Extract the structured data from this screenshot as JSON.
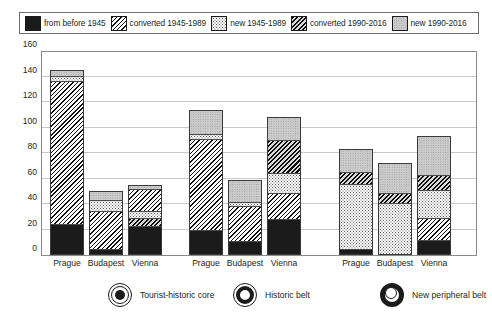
{
  "series_legend": [
    {
      "label": "from before 1945",
      "pattern": "solid-black",
      "fill_class": "f-black"
    },
    {
      "label": "converted 1945-1989",
      "pattern": "diagonal-hatch",
      "fill_class": "f-hatch"
    },
    {
      "label": "new 1945-1989",
      "pattern": "fine-dots",
      "fill_class": "f-dots"
    },
    {
      "label": "converted 1990-2016",
      "pattern": "dense-hatch",
      "fill_class": "f-hatch2"
    },
    {
      "label": "new 1990-2016",
      "pattern": "light-gray",
      "fill_class": "f-lgray"
    }
  ],
  "zone_legend": [
    {
      "label": "Tourist-historic core",
      "icon": "target-filled-circle-icon",
      "icon_class": "ic-core"
    },
    {
      "label": "Historic belt",
      "icon": "thick-ring-circle-icon",
      "icon_class": "ic-belt"
    },
    {
      "label": "New peripheral belt",
      "icon": "thick-outer-ring-circle-icon",
      "icon_class": "ic-periph"
    }
  ],
  "chart_data": {
    "type": "bar",
    "subtype": "stacked-grouped",
    "title": "",
    "xlabel": "",
    "ylabel": "",
    "ylim": [
      0,
      160
    ],
    "yticks": [
      0,
      20,
      40,
      60,
      80,
      100,
      120,
      140,
      160
    ],
    "grid": true,
    "legend_position": "top",
    "categories": [
      "Prague",
      "Budapest",
      "Vienna"
    ],
    "groups": [
      "Tourist-historic core",
      "Historic belt",
      "New peripheral belt"
    ],
    "series": [
      {
        "name": "from before 1945",
        "values": [
          [
            23,
            3,
            22
          ],
          [
            18,
            10,
            27
          ],
          [
            3,
            0,
            10
          ]
        ]
      },
      {
        "name": "converted 1945-1989",
        "values": [
          [
            113,
            31,
            18
          ],
          [
            73,
            28,
            21
          ],
          [
            0,
            0,
            18
          ]
        ]
      },
      {
        "name": "new 1945-1989",
        "values": [
          [
            4,
            9,
            6
          ],
          [
            4,
            3,
            16
          ],
          [
            52,
            40,
            22
          ]
        ]
      },
      {
        "name": "converted 1990-2016",
        "values": [
          [
            0,
            0,
            6
          ],
          [
            0,
            0,
            26
          ],
          [
            10,
            8,
            12
          ]
        ]
      },
      {
        "name": "new 1990-2016",
        "values": [
          [
            5,
            7,
            3
          ],
          [
            19,
            18,
            18
          ],
          [
            18,
            24,
            31
          ]
        ]
      }
    ],
    "totals": [
      [
        145,
        50,
        55
      ],
      [
        114,
        59,
        108
      ],
      [
        83,
        72,
        93
      ]
    ],
    "stack_order": [
      "from before 1945",
      "converted 1945-1989",
      "new 1945-1989",
      "converted 1990-2016",
      "new 1990-2016"
    ],
    "stack_order_vienna_core": [
      "from before 1945",
      "converted 1990-2016",
      "new 1945-1989",
      "converted 1945-1989",
      "new 1990-2016"
    ],
    "stack_order_vienna_belt": [
      "from before 1945",
      "converted 1945-1989",
      "new 1945-1989",
      "converted 1990-2016",
      "new 1990-2016"
    ],
    "stack_order_periph": [
      "from before 1945",
      "converted 1945-1989",
      "new 1945-1989",
      "converted 1990-2016",
      "new 1990-2016"
    ]
  }
}
